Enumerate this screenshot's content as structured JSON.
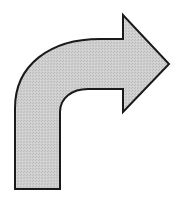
{
  "figure": {
    "description": "Curved arrow turning right",
    "icon": "curved-right-arrow-icon",
    "fill_color": "#c8c8c8",
    "stroke_color": "#1a1a1a",
    "background": "#ffffff"
  }
}
